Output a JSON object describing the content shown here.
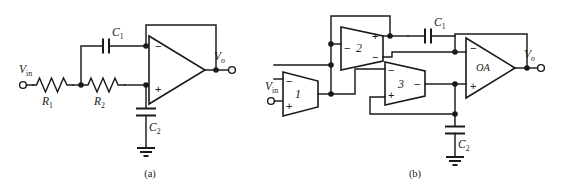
{
  "figure": {
    "background_color": "#ffffff",
    "line_color": "#1a1a1a",
    "subfigures": [
      {
        "id": "a",
        "caption": "(a)",
        "description": "Sallen-Key low-pass filter using a single operational amplifier"
      },
      {
        "id": "b",
        "caption": "(b)",
        "description": "Equivalent realization using three operational transconductance amplifiers and an output op-amp"
      }
    ]
  },
  "circuit_a": {
    "caption": "(a)",
    "input_label": "V",
    "input_sub": "in",
    "output_label": "V",
    "output_sub": "o",
    "components": [
      {
        "name": "resistor-r1",
        "label": "R",
        "sub": "1",
        "type": "resistor"
      },
      {
        "name": "resistor-r2",
        "label": "R",
        "sub": "2",
        "type": "resistor"
      },
      {
        "name": "capacitor-c1",
        "label": "C",
        "sub": "1",
        "type": "capacitor"
      },
      {
        "name": "capacitor-c2",
        "label": "C",
        "sub": "2",
        "type": "capacitor"
      },
      {
        "name": "opamp-a",
        "label": "",
        "type": "opamp",
        "inputs": [
          "−",
          "+"
        ]
      },
      {
        "name": "ground-a",
        "type": "ground"
      }
    ],
    "opamp_minus": "−",
    "opamp_plus": "+"
  },
  "circuit_b": {
    "caption": "(b)",
    "input_label": "V",
    "input_sub": "in",
    "output_label": "V",
    "output_sub": "o",
    "components": [
      {
        "name": "ota-1",
        "label": "1",
        "type": "ota",
        "left_signs": [
          "−",
          "+"
        ]
      },
      {
        "name": "ota-2",
        "label": "2",
        "type": "ota",
        "left_signs": [
          "−"
        ],
        "right_signs": [
          "+",
          "−"
        ]
      },
      {
        "name": "ota-3",
        "label": "3",
        "type": "ota",
        "left_signs": [
          "−",
          "+"
        ],
        "right_signs": [
          "−"
        ]
      },
      {
        "name": "opamp-oa",
        "label": "OA",
        "type": "opamp",
        "left_signs": [
          "−",
          "+"
        ]
      },
      {
        "name": "capacitor-c1",
        "label": "C",
        "sub": "1",
        "type": "capacitor"
      },
      {
        "name": "capacitor-c2",
        "label": "C",
        "sub": "2",
        "type": "capacitor"
      },
      {
        "name": "ground-b",
        "type": "ground"
      }
    ],
    "amp1_label": "1",
    "amp2_label": "2",
    "amp3_label": "3",
    "amp_oa_label": "OA",
    "sign_minus": "−",
    "sign_plus": "+"
  }
}
